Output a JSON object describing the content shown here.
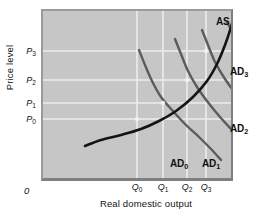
{
  "chart_data": {
    "type": "line",
    "title": "",
    "xlabel": "Real domestic output",
    "ylabel": "Price level",
    "origin_label": "0",
    "grid": true,
    "legend_position": "inline-curve-labels",
    "xlim": [
      0,
      10
    ],
    "ylim": [
      0,
      10
    ],
    "x_ticks": [
      {
        "label": "Q",
        "sub": "0",
        "px": 137
      },
      {
        "label": "Q",
        "sub": "1",
        "px": 163
      },
      {
        "label": "Q",
        "sub": "2",
        "px": 187
      },
      {
        "label": "Q",
        "sub": "3",
        "px": 206
      }
    ],
    "y_ticks": [
      {
        "label": "P",
        "sub": "3",
        "px": 51
      },
      {
        "label": "P",
        "sub": "2",
        "px": 80
      },
      {
        "label": "P",
        "sub": "1",
        "px": 103
      },
      {
        "label": "P",
        "sub": "0",
        "px": 119
      }
    ],
    "series": [
      {
        "name": "AS",
        "label": "AS",
        "sub": "",
        "kind": "aggregate-supply",
        "color": "#141414",
        "label_px": [
          214,
          14
        ],
        "points": [
          [
            44,
            137
          ],
          [
            60,
            131
          ],
          [
            80,
            126
          ],
          [
            100,
            120
          ],
          [
            118,
            112
          ],
          [
            135,
            102
          ],
          [
            152,
            88
          ],
          [
            166,
            72
          ],
          [
            176,
            55
          ],
          [
            184,
            36
          ],
          [
            190,
            18
          ],
          [
            193,
            6
          ]
        ]
      },
      {
        "name": "AD0",
        "label": "AD",
        "sub": "0",
        "kind": "aggregate-demand",
        "color": "#5c5c5c",
        "label_px": [
          168,
          156
        ],
        "points": [
          [
            98,
            41
          ],
          [
            104,
            56
          ],
          [
            111,
            72
          ],
          [
            120,
            88
          ],
          [
            131,
            101
          ],
          [
            145,
            116
          ],
          [
            158,
            128
          ],
          [
            170,
            140
          ],
          [
            180,
            151
          ]
        ]
      },
      {
        "name": "AD1",
        "label": "AD",
        "sub": "1",
        "kind": "aggregate-demand",
        "color": "#5c5c5c",
        "label_px": [
          200,
          156
        ],
        "points": [
          [
            134,
            30
          ],
          [
            140,
            45
          ],
          [
            147,
            62
          ],
          [
            156,
            78
          ],
          [
            166,
            92
          ],
          [
            179,
            108
          ],
          [
            192,
            122
          ],
          [
            203,
            134
          ],
          [
            212,
            146
          ]
        ]
      },
      {
        "name": "AD2",
        "label": "AD",
        "sub": "2",
        "kind": "aggregate-demand",
        "color": "#5c5c5c",
        "label_px": [
          228,
          121
        ],
        "points": [
          [
            161,
            21
          ],
          [
            167,
            36
          ],
          [
            174,
            53
          ],
          [
            184,
            70
          ],
          [
            195,
            85
          ],
          [
            208,
            100
          ],
          [
            221,
            112
          ],
          [
            233,
            122
          ],
          [
            243,
            131
          ]
        ]
      },
      {
        "name": "AD3",
        "label": "AD",
        "sub": "3",
        "kind": "aggregate-demand",
        "color": "#5c5c5c",
        "label_px": [
          228,
          64
        ],
        "points": [
          [
            186,
            13
          ],
          [
            193,
            26
          ],
          [
            201,
            39
          ],
          [
            210,
            53
          ],
          [
            221,
            66
          ],
          [
            234,
            78
          ],
          [
            247,
            88
          ],
          [
            258,
            95
          ],
          [
            266,
            100
          ]
        ]
      }
    ],
    "equilibria": [
      {
        "name": "E0",
        "x_tick": "Q0",
        "y_tick": "P0",
        "px": [
          137,
          119
        ]
      },
      {
        "name": "E1",
        "x_tick": "Q1",
        "y_tick": "P1",
        "px": [
          163,
          103
        ]
      },
      {
        "name": "E2",
        "x_tick": "Q2",
        "y_tick": "P2",
        "px": [
          187,
          80
        ]
      },
      {
        "name": "E3",
        "x_tick": "Q3",
        "y_tick": "P3",
        "px": [
          206,
          51
        ]
      }
    ],
    "colors": {
      "plot_background": "#c6c6c6",
      "gridline": "#ededed",
      "as_curve": "#141414",
      "ad_curve": "#5c5c5c",
      "text": "#141414",
      "frame_light": "#9a9a9a",
      "frame_dark": "#7f7f7f"
    }
  }
}
